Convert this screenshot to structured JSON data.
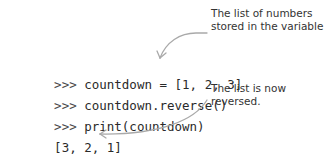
{
  "code_lines": [
    {
      "prompt": ">>>",
      "code": "countdown = [1, 2, 3]"
    },
    {
      "prompt": ">>>",
      "code": "countdown.reverse()"
    },
    {
      "prompt": ">>>",
      "code": "print(countdown)"
    },
    {
      "prompt": "",
      "code": "[3, 2, 1]"
    }
  ],
  "annotations": {
    "top": {
      "line1": "The list of numbers",
      "line2": "stored in the variable"
    },
    "bottom": {
      "line1": "The list is now",
      "line2": "reversed."
    }
  },
  "colors": {
    "arrow": "#a9a9a9",
    "text": "#333333"
  }
}
